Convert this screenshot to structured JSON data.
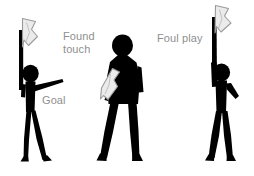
{
  "image": {
    "title": "Assistant referee flag signals",
    "background_color": "#ffffff",
    "figure_color": "#000000",
    "flag_fill_color": "#ebebeb",
    "flag_outline_color": "#9a9a9a",
    "label_color": "#8f8f8f",
    "width": 254,
    "height": 176
  },
  "labels": {
    "goal": "Goal",
    "found_touch": "Found\ntouch",
    "foul_play": "Foul play"
  },
  "figures": [
    {
      "id": "figure-goal",
      "label": "Goal",
      "pose": "standing, flag held upright at side, free arm pointing straight ahead",
      "flag_position": "raised vertical at left side"
    },
    {
      "id": "figure-found-touch",
      "label": "Found touch",
      "pose": "standing, arms lowered, flag hanging down by hip",
      "flag_position": "lowered at hip"
    },
    {
      "id": "figure-foul-play",
      "label": "Foul play",
      "pose": "standing, one arm raised high holding flag overhead",
      "flag_position": "raised straight overhead"
    }
  ]
}
